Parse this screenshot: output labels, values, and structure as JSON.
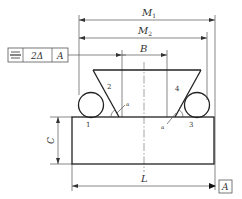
{
  "figure": {
    "type": "engineering drawing - dovetail measurement with rollers",
    "dimensions": {
      "M1": {
        "label": "M",
        "sub": "1"
      },
      "M2": {
        "label": "M",
        "sub": "2"
      },
      "B": {
        "label": "B"
      },
      "C": {
        "label": "C"
      },
      "L": {
        "label": "L"
      }
    },
    "tolerance_frame": {
      "symbol": "symmetry-icon",
      "value": "2Δ",
      "datum": "A"
    },
    "datum_box": {
      "label": "A"
    },
    "part_numbers": [
      "1",
      "2",
      "3",
      "4"
    ],
    "angle_labels": [
      "α",
      "α"
    ],
    "colors": {
      "line": "#222222",
      "thin_line": "#555555",
      "background": "#ffffff"
    }
  }
}
